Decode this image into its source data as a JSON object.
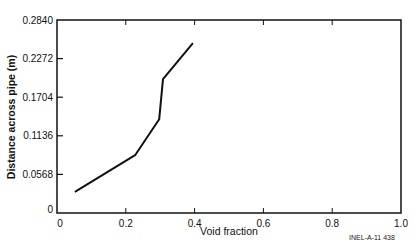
{
  "chart_data": {
    "type": "line",
    "title": "",
    "xlabel": "Void fraction",
    "ylabel": "Distance across pipe (m)",
    "xlim": [
      0,
      1.0
    ],
    "ylim": [
      0,
      0.284
    ],
    "xticks": [
      "0",
      "0.2",
      "0.4",
      "0.6",
      "0.8",
      "1.0"
    ],
    "yticks": [
      "0",
      "0.0568",
      "0.1136",
      "0.1704",
      "0.2272",
      "0.2840"
    ],
    "grid": false,
    "legend": null,
    "series": [
      {
        "name": "Void fraction profile",
        "x": [
          0.052,
          0.227,
          0.297,
          0.308,
          0.395
        ],
        "y": [
          0.031,
          0.085,
          0.138,
          0.197,
          0.25
        ]
      }
    ],
    "annotations": [
      "INEL-A-11 438"
    ]
  },
  "labels": {
    "xlabel": "Void fraction",
    "ylabel": "Distance across pipe (m)",
    "figure_code": "INEL-A-11 438",
    "xticks": [
      "0",
      "0.2",
      "0.4",
      "0.6",
      "0.8",
      "1.0"
    ],
    "yticks": [
      "0",
      "0.0568",
      "0.1136",
      "0.1704",
      "0.2272",
      "0.2840"
    ]
  }
}
